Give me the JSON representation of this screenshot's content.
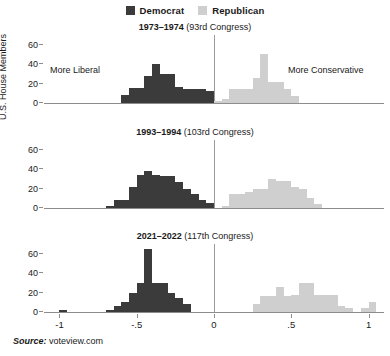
{
  "legend": {
    "items": [
      {
        "label": "Democrat",
        "color": "#3b3b3b",
        "icon": "square-swatch-icon"
      },
      {
        "label": "Republican",
        "color": "#cfcfcf",
        "icon": "square-swatch-icon"
      }
    ]
  },
  "axis": {
    "ylabel": "U.S. House Members",
    "yticks": [
      "0",
      "20",
      "40",
      "60"
    ],
    "ytick_values": [
      0,
      20,
      40,
      60
    ],
    "ylim": [
      0,
      70
    ],
    "xticks": [
      "-1",
      "-.5",
      "0",
      ".5",
      "1"
    ],
    "xtick_values": [
      -1,
      -0.5,
      0,
      0.5,
      1
    ],
    "xlim": [
      -1.1,
      1.1
    ],
    "grid": false
  },
  "annotations": {
    "more_liberal": "More Liberal",
    "more_conservative": "More Conservative"
  },
  "source": {
    "prefix": "Source:",
    "text": " voteview.com"
  },
  "chart_data": {
    "type": "bar",
    "xlabel": "",
    "ylabel": "U.S. House Members",
    "ylim": [
      0,
      70
    ],
    "xlim": [
      -1.1,
      1.1
    ],
    "grid": false,
    "legend_position": "top-center",
    "bin_width": 0.05,
    "panels": [
      {
        "title_bold": "1973–1974",
        "title_rest": " (93rd Congress)",
        "series": [
          {
            "name": "Democrat",
            "color": "#3b3b3b",
            "bins": [
              -0.6,
              -0.55,
              -0.5,
              -0.45,
              -0.4,
              -0.35,
              -0.3,
              -0.25,
              -0.2,
              -0.15,
              -0.1,
              -0.05
            ],
            "values": [
              8,
              15,
              15,
              28,
              40,
              30,
              30,
              16,
              14,
              14,
              14,
              12
            ]
          },
          {
            "name": "Republican",
            "color": "#cfcfcf",
            "bins": [
              0.0,
              0.05,
              0.1,
              0.15,
              0.2,
              0.25,
              0.3,
              0.35,
              0.4,
              0.45,
              0.5
            ],
            "values": [
              2,
              4,
              14,
              14,
              14,
              26,
              50,
              22,
              22,
              14,
              7
            ]
          }
        ]
      },
      {
        "title_bold": "1993–1994",
        "title_rest": " (103rd Congress)",
        "series": [
          {
            "name": "Democrat",
            "color": "#3b3b3b",
            "bins": [
              -0.7,
              -0.65,
              -0.6,
              -0.55,
              -0.5,
              -0.45,
              -0.4,
              -0.35,
              -0.3,
              -0.25,
              -0.2,
              -0.15,
              -0.1,
              -0.05
            ],
            "values": [
              2,
              8,
              8,
              22,
              34,
              38,
              34,
              33,
              33,
              27,
              20,
              14,
              8,
              5
            ]
          },
          {
            "name": "Republican",
            "color": "#cfcfcf",
            "bins": [
              0.05,
              0.1,
              0.15,
              0.2,
              0.25,
              0.3,
              0.35,
              0.4,
              0.45,
              0.5,
              0.55,
              0.6,
              0.65
            ],
            "values": [
              2,
              14,
              14,
              16,
              20,
              20,
              30,
              28,
              28,
              22,
              20,
              10,
              4
            ]
          }
        ]
      },
      {
        "title_bold": "2021–2022",
        "title_rest": " (117th Congress)",
        "series": [
          {
            "name": "Democrat",
            "color": "#3b3b3b",
            "bins": [
              -1.0,
              -0.7,
              -0.65,
              -0.6,
              -0.55,
              -0.5,
              -0.45,
              -0.4,
              -0.35,
              -0.3,
              -0.25,
              -0.2
            ],
            "values": [
              2,
              2,
              6,
              10,
              20,
              30,
              65,
              30,
              30,
              20,
              14,
              8
            ]
          },
          {
            "name": "Republican",
            "color": "#cfcfcf",
            "bins": [
              0.25,
              0.3,
              0.35,
              0.4,
              0.45,
              0.5,
              0.55,
              0.6,
              0.65,
              0.7,
              0.75,
              0.8,
              0.85,
              0.95,
              1.0
            ],
            "values": [
              8,
              16,
              16,
              26,
              16,
              18,
              30,
              30,
              18,
              18,
              18,
              6,
              4,
              4,
              10
            ]
          }
        ]
      }
    ]
  }
}
